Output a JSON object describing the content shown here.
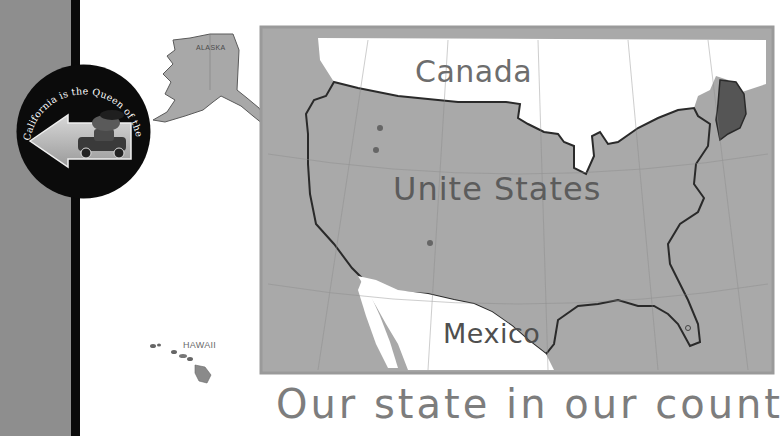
{
  "sidebar": {
    "bar_color": "#8e8e8e",
    "stripe_color": "#0a0a0a"
  },
  "badge": {
    "text": "California is the Queen of the West",
    "image": "arrow-with-car-illustration"
  },
  "insets": {
    "alaska_label": "ALASKA",
    "hawaii_label": "HAWAII"
  },
  "map": {
    "labels": {
      "canada": "Canada",
      "united_states": "Unite States",
      "mexico": "Mexico"
    },
    "colors": {
      "land": "#a9a9a9",
      "foreign": "#ffffff",
      "outline": "#2a2a2a",
      "highlight": "#555555"
    }
  },
  "caption": "Our state in our country"
}
